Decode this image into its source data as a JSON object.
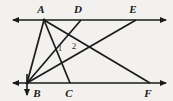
{
  "figure": {
    "background_color": "#f2f1ef",
    "stroke_color": "#1a1a1a",
    "width": 173,
    "height": 101,
    "points": [
      {
        "id": "A",
        "label": "A",
        "x": 44,
        "y": 20,
        "label_x": 41,
        "label_y": 13
      },
      {
        "id": "D",
        "label": "D",
        "x": 81,
        "y": 20,
        "label_x": 78,
        "label_y": 13
      },
      {
        "id": "E",
        "label": "E",
        "x": 136,
        "y": 20,
        "label_x": 133,
        "label_y": 13
      },
      {
        "id": "B",
        "label": "B",
        "x": 27,
        "y": 83,
        "label_x": 33,
        "label_y": 95
      },
      {
        "id": "C",
        "label": "C",
        "x": 70,
        "y": 83,
        "label_x": 68,
        "label_y": 95
      },
      {
        "id": "F",
        "label": "F",
        "x": 150,
        "y": 83,
        "label_x": 146,
        "label_y": 95
      }
    ],
    "angle_labels": [
      {
        "id": "1",
        "label": "1",
        "x": 59,
        "y": 50
      },
      {
        "id": "2",
        "label": "2",
        "x": 73,
        "y": 48
      }
    ],
    "rays": [
      {
        "name": "top-parallel-ray",
        "x1": 13,
        "y1": 20,
        "x2": 166,
        "y2": 20,
        "arrow_start": true,
        "arrow_end": true
      },
      {
        "name": "bottom-parallel-ray",
        "x1": 13,
        "y1": 83,
        "x2": 166,
        "y2": 83,
        "arrow_start": true,
        "arrow_end": true
      },
      {
        "name": "downward-ray-at-B",
        "x1": 27,
        "y1": 75,
        "x2": 27,
        "y2": 95,
        "arrow_start": false,
        "arrow_end": true
      }
    ],
    "segments": [
      {
        "name": "segment-A-B",
        "from": "A",
        "to": "B"
      },
      {
        "name": "segment-A-C",
        "from": "A",
        "to": "C"
      },
      {
        "name": "segment-A-F",
        "from": "A",
        "to": "F"
      },
      {
        "name": "segment-D-B",
        "from": "D",
        "to": "B"
      },
      {
        "name": "segment-E-B",
        "from": "E",
        "to": "B"
      }
    ]
  }
}
